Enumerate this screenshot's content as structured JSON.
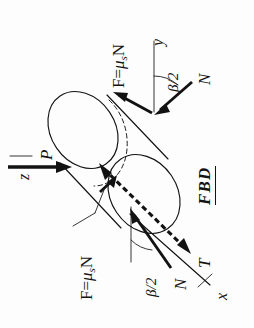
{
  "diagram": {
    "title": "FBD",
    "kind": "free-body-diagram",
    "labels": {
      "friction_top": {
        "text": "F = μsN",
        "prefix": "F",
        "equals": "=",
        "mu": "μ",
        "sub": "s",
        "suffix": "N"
      },
      "friction_bottom": {
        "text": "F = μsN",
        "prefix": "F",
        "equals": "=",
        "mu": "μ",
        "sub": "s",
        "suffix": "N"
      },
      "normal_top": "N",
      "normal_bottom": "N",
      "applied_load": "P",
      "torque": "T",
      "angle_top": "β/2",
      "angle_bottom": "β/2",
      "axis_x": "x",
      "axis_y": "y",
      "axis_z": "z"
    },
    "forces": [
      {
        "symbol": "P",
        "name": "applied-load",
        "type": "force",
        "direction": "along-z"
      },
      {
        "symbol": "N",
        "name": "normal-force-upper",
        "type": "force",
        "contact": "upper-vee-face"
      },
      {
        "symbol": "N",
        "name": "normal-force-lower",
        "type": "force",
        "contact": "lower-vee-face"
      },
      {
        "symbol": "F = μsN",
        "name": "friction-force-upper",
        "type": "friction"
      },
      {
        "symbol": "F = μsN",
        "name": "friction-force-lower",
        "type": "friction"
      },
      {
        "symbol": "T",
        "name": "torque",
        "type": "moment",
        "direction": "along-x"
      }
    ],
    "angles": [
      {
        "symbol": "β/2",
        "name": "half-vee-angle-upper"
      },
      {
        "symbol": "β/2",
        "name": "half-vee-angle-lower"
      }
    ],
    "axes": [
      {
        "symbol": "x",
        "name": "x-axis"
      },
      {
        "symbol": "y",
        "name": "y-axis"
      },
      {
        "symbol": "z",
        "name": "z-axis"
      }
    ],
    "colors": {
      "ink": "#121212",
      "paper": "#fdfdfd"
    }
  }
}
